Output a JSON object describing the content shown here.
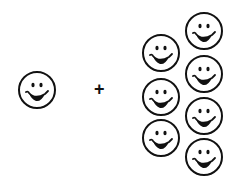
{
  "diagram": {
    "operator": "+",
    "left_group": {
      "count": 1,
      "icon": "smiley-face-icon"
    },
    "right_group": {
      "count": 7,
      "icon": "smiley-face-icon"
    }
  },
  "colors": {
    "stroke": "#111111",
    "background": "#ffffff"
  }
}
